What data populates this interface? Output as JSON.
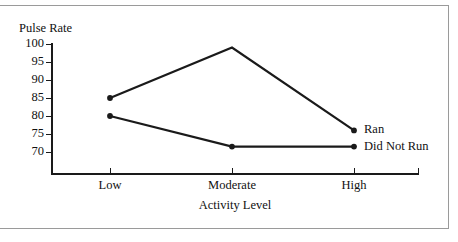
{
  "figure": {
    "background_color": "#ffffff",
    "frame_color": "#9a9a9a",
    "ink_color": "#1a1a1a"
  },
  "chart_data": {
    "type": "line",
    "title": "",
    "xlabel": "Activity Level",
    "ylabel": "Pulse Rate",
    "categories": [
      "Low",
      "Moderate",
      "High"
    ],
    "ylim": [
      68,
      100
    ],
    "yticks": [
      100,
      95,
      90,
      85,
      80,
      75,
      70
    ],
    "ytick_labels": [
      "100",
      "95",
      "90",
      "85",
      "80",
      "75",
      "70"
    ],
    "grid": false,
    "legend_position": "right-of-line-ends",
    "series": [
      {
        "name": "Ran",
        "values": [
          85,
          99,
          76
        ],
        "color": "#1a1a1a",
        "marker": "circle"
      },
      {
        "name": "Did Not Run",
        "values": [
          80,
          71.5,
          71.5
        ],
        "color": "#1a1a1a",
        "marker": "circle"
      }
    ],
    "annotations": [
      {
        "text": "Ran",
        "at_category": "High",
        "series": "Ran"
      },
      {
        "text": "Did Not Run",
        "at_category": "High",
        "series": "Did Not Run"
      }
    ]
  }
}
